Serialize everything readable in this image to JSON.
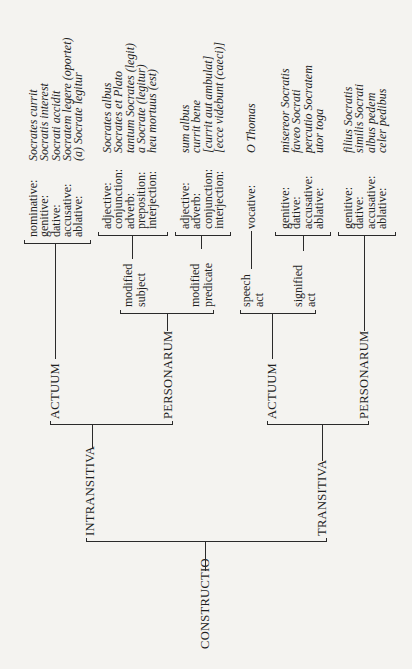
{
  "root": "CONSTRUCTIO",
  "branches": {
    "intransitiva": {
      "label": "INTRANSITIVA",
      "actuum": {
        "label": "ACTUUM",
        "rows": [
          {
            "case": "nominative:",
            "example": "Socrates currit"
          },
          {
            "case": "genitive:",
            "example": "Socratis interest"
          },
          {
            "case": "dative:",
            "example": "Socrati accidit"
          },
          {
            "case": "accusative:",
            "example": "Socratem legere (oportet)"
          },
          {
            "case": "ablative:",
            "example": "(a) Socrate legitur"
          }
        ]
      },
      "personarum": {
        "label": "PERSONARUM",
        "modified_subject": {
          "label_line1": "modified",
          "label_line2": "subject",
          "rows": [
            {
              "case": "adjective:",
              "example": "Socrates albus"
            },
            {
              "case": "conjunction:",
              "example": "Socrates et Plato"
            },
            {
              "case": "adverb:",
              "example": "tantum Socrates (legit)"
            },
            {
              "case": "preposition:",
              "example": "a Socrate (legitur)"
            },
            {
              "case": "interjection:",
              "example": "heu mortuus (est)"
            }
          ]
        },
        "modified_predicate": {
          "label_line1": "modified",
          "label_line2": "predicate",
          "rows": [
            {
              "case": "adjective:",
              "example": "sum albus"
            },
            {
              "case": "adverb:",
              "example": "currit bene"
            },
            {
              "case": "conjunction:",
              "example": "[currit aut ambulat]"
            },
            {
              "case": "interjection:",
              "example": "[ecce videbunt (caeci)]"
            }
          ]
        }
      }
    },
    "transitiva": {
      "label": "TRANSITIVA",
      "actuum": {
        "label": "ACTUUM",
        "speech_act": {
          "label_line1": "speech",
          "label_line2": "act",
          "rows": [
            {
              "case": "vocative:",
              "example": "O Thomas"
            }
          ]
        },
        "signified_act": {
          "label_line1": "signified",
          "label_line2": "act",
          "rows": [
            {
              "case": "genitive:",
              "example": "misereor Socratis"
            },
            {
              "case": "dative:",
              "example": "faveo Socrati"
            },
            {
              "case": "accusative:",
              "example": "percutio Socratem"
            },
            {
              "case": "ablative:",
              "example": "utor toga"
            }
          ]
        }
      },
      "personarum": {
        "label": "PERSONARUM",
        "rows": [
          {
            "case": "genitive:",
            "example": "filius Socratis"
          },
          {
            "case": "dative:",
            "example": "similis Socrati"
          },
          {
            "case": "accusative:",
            "example": "albus pedem"
          },
          {
            "case": "ablative:",
            "example": "celer pedibus"
          }
        ]
      }
    }
  },
  "colors": {
    "ink": "#1f1f1f",
    "paper": "#f4f3f0"
  }
}
